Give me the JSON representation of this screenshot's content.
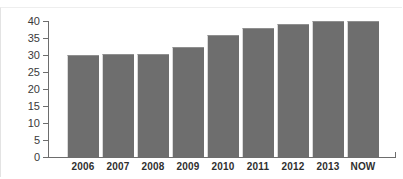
{
  "caption_remnant": "",
  "chart_data": {
    "type": "bar",
    "title": "",
    "xlabel": "",
    "ylabel": "",
    "categories": [
      "2006",
      "2007",
      "2008",
      "2009",
      "2010",
      "2011",
      "2012",
      "2013",
      "NOW"
    ],
    "values": [
      30,
      30.2,
      30.3,
      32.5,
      36,
      38,
      39,
      40,
      40
    ],
    "ylim": [
      0,
      40
    ],
    "ytick_labels": [
      "40",
      "35",
      "30",
      "25",
      "20",
      "15",
      "10",
      "5",
      "0"
    ],
    "ytick_values": [
      40,
      35,
      30,
      25,
      20,
      15,
      10,
      5,
      0
    ],
    "grid": false,
    "legend": null,
    "bar_color": "#6e6e6e",
    "axis_color": "#6d6d6d",
    "background_color": "#ffffff"
  }
}
